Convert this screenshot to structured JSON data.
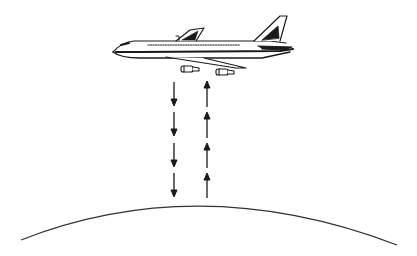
{
  "diagram": {
    "background": "#ffffff",
    "stroke_color": "#1a1a1a",
    "elements": {
      "airplane": {
        "label": "",
        "icon": "airplane-icon"
      },
      "down_arrows": {
        "count": 4,
        "direction": "down",
        "icon": "arrow-down-icon"
      },
      "up_arrows": {
        "count": 4,
        "direction": "up",
        "icon": "arrow-up-icon"
      },
      "ground": {
        "shape": "arc",
        "icon": "earth-surface-curve"
      }
    }
  }
}
